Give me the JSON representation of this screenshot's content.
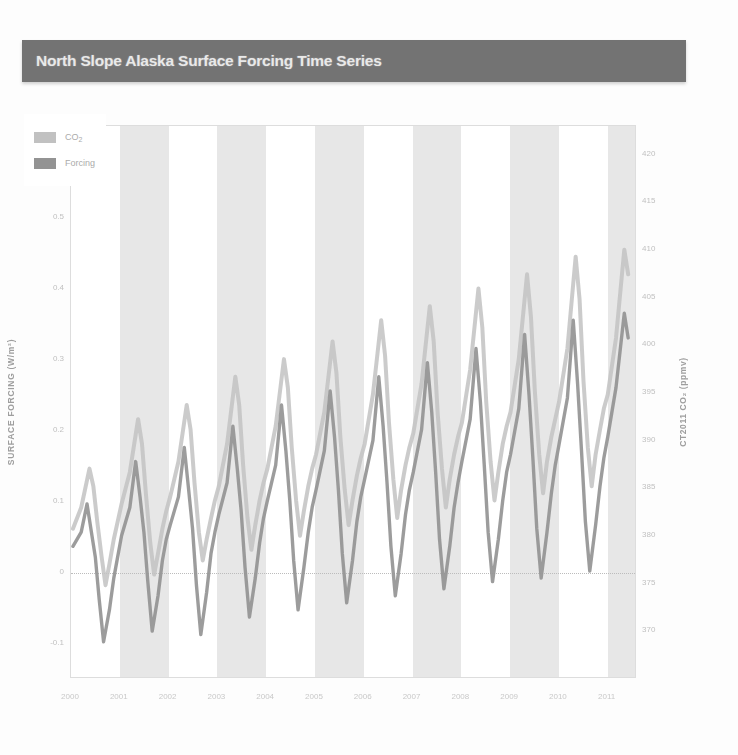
{
  "header": {
    "title": "North Slope Alaska Surface Forcing Time Series",
    "banner_color": "#737373",
    "title_color": "#f2f2f2"
  },
  "chart_data": {
    "type": "line",
    "title": "North Slope Alaska Surface Forcing Time Series",
    "ylabel_left": "SURFACE FORCING (W/m²)",
    "ylabel_right": "CT2011 CO₂ (ppmv)",
    "xlabel": "",
    "grid": false,
    "legend_position": "top-left",
    "zero_reference_line": true,
    "year_shading": true,
    "ylim_left": [
      -0.15,
      0.63
    ],
    "ylim_right": [
      365,
      423
    ],
    "yticks_left": [
      0.6,
      0.5,
      0.4,
      0.3,
      0.2,
      0.1,
      0,
      -0.1
    ],
    "ytick_labels_left": [
      "0.6",
      "0.5",
      "0.4",
      "0.3",
      "0.2",
      "0.1",
      "0",
      "-0.1"
    ],
    "yticks_right": [
      420,
      415,
      410,
      405,
      400,
      395,
      390,
      385,
      380,
      375,
      370
    ],
    "ytick_labels_right": [
      "420",
      "415",
      "410",
      "405",
      "400",
      "395",
      "390",
      "385",
      "380",
      "375",
      "370"
    ],
    "xlim": [
      2000,
      2011.6
    ],
    "xticks": [
      2000,
      2001,
      2002,
      2003,
      2004,
      2005,
      2006,
      2007,
      2008,
      2009,
      2010,
      2011
    ],
    "xtick_labels": [
      "2000",
      "2001",
      "2002",
      "2003",
      "2004",
      "2005",
      "2006",
      "2007",
      "2008",
      "2009",
      "2010",
      "2011"
    ],
    "series": [
      {
        "name": "CO2",
        "color": "#bfbfbf",
        "axis": "right",
        "x": [
          2000.04,
          2000.21,
          2000.38,
          2000.46,
          2000.54,
          2000.63,
          2000.71,
          2000.79,
          2000.88,
          2000.96,
          2001.04,
          2001.21,
          2001.38,
          2001.46,
          2001.54,
          2001.63,
          2001.71,
          2001.79,
          2001.88,
          2001.96,
          2002.04,
          2002.21,
          2002.38,
          2002.46,
          2002.54,
          2002.63,
          2002.71,
          2002.79,
          2002.88,
          2002.96,
          2003.04,
          2003.21,
          2003.38,
          2003.46,
          2003.54,
          2003.63,
          2003.71,
          2003.79,
          2003.88,
          2003.96,
          2004.04,
          2004.21,
          2004.38,
          2004.46,
          2004.54,
          2004.63,
          2004.71,
          2004.79,
          2004.88,
          2004.96,
          2005.04,
          2005.21,
          2005.38,
          2005.46,
          2005.54,
          2005.63,
          2005.71,
          2005.79,
          2005.88,
          2005.96,
          2006.04,
          2006.21,
          2006.38,
          2006.46,
          2006.54,
          2006.63,
          2006.71,
          2006.79,
          2006.88,
          2006.96,
          2007.04,
          2007.21,
          2007.38,
          2007.46,
          2007.54,
          2007.63,
          2007.71,
          2007.79,
          2007.88,
          2007.96,
          2008.04,
          2008.21,
          2008.38,
          2008.46,
          2008.54,
          2008.63,
          2008.71,
          2008.79,
          2008.88,
          2008.96,
          2009.04,
          2009.21,
          2009.38,
          2009.46,
          2009.54,
          2009.63,
          2009.71,
          2009.79,
          2009.88,
          2009.96,
          2010.04,
          2010.21,
          2010.38,
          2010.46,
          2010.54,
          2010.63,
          2010.71,
          2010.79,
          2010.88,
          2010.96,
          2011.04,
          2011.21,
          2011.38,
          2011.46
        ],
        "values": [
          0.06,
          0.09,
          0.145,
          0.12,
          0.07,
          0.02,
          -0.02,
          0.01,
          0.045,
          0.07,
          0.095,
          0.14,
          0.215,
          0.18,
          0.11,
          0.04,
          -0.005,
          0.025,
          0.06,
          0.085,
          0.105,
          0.155,
          0.235,
          0.2,
          0.125,
          0.055,
          0.015,
          0.045,
          0.075,
          0.1,
          0.12,
          0.18,
          0.275,
          0.235,
          0.15,
          0.075,
          0.03,
          0.065,
          0.1,
          0.125,
          0.145,
          0.205,
          0.3,
          0.26,
          0.175,
          0.1,
          0.05,
          0.085,
          0.12,
          0.145,
          0.165,
          0.225,
          0.325,
          0.28,
          0.19,
          0.115,
          0.065,
          0.1,
          0.135,
          0.16,
          0.18,
          0.25,
          0.355,
          0.305,
          0.21,
          0.13,
          0.075,
          0.115,
          0.15,
          0.175,
          0.195,
          0.265,
          0.375,
          0.325,
          0.225,
          0.145,
          0.09,
          0.13,
          0.165,
          0.19,
          0.21,
          0.285,
          0.4,
          0.345,
          0.24,
          0.155,
          0.1,
          0.14,
          0.18,
          0.205,
          0.225,
          0.3,
          0.42,
          0.36,
          0.255,
          0.165,
          0.11,
          0.155,
          0.19,
          0.215,
          0.24,
          0.315,
          0.445,
          0.385,
          0.27,
          0.175,
          0.12,
          0.165,
          0.2,
          0.23,
          0.25,
          0.33,
          0.455,
          0.42
        ]
      },
      {
        "name": "Forcing",
        "color": "#8f8f8f",
        "axis": "left",
        "x": [
          2000.04,
          2000.21,
          2000.33,
          2000.42,
          2000.5,
          2000.58,
          2000.67,
          2000.79,
          2000.88,
          2000.96,
          2001.04,
          2001.21,
          2001.33,
          2001.42,
          2001.5,
          2001.58,
          2001.67,
          2001.79,
          2001.88,
          2001.96,
          2002.04,
          2002.21,
          2002.33,
          2002.42,
          2002.5,
          2002.58,
          2002.67,
          2002.79,
          2002.88,
          2002.96,
          2003.04,
          2003.21,
          2003.33,
          2003.42,
          2003.5,
          2003.58,
          2003.67,
          2003.79,
          2003.88,
          2003.96,
          2004.04,
          2004.21,
          2004.33,
          2004.42,
          2004.5,
          2004.58,
          2004.67,
          2004.79,
          2004.88,
          2004.96,
          2005.04,
          2005.21,
          2005.33,
          2005.42,
          2005.5,
          2005.58,
          2005.67,
          2005.79,
          2005.88,
          2005.96,
          2006.04,
          2006.21,
          2006.33,
          2006.42,
          2006.5,
          2006.58,
          2006.67,
          2006.79,
          2006.88,
          2006.96,
          2007.04,
          2007.21,
          2007.33,
          2007.42,
          2007.5,
          2007.58,
          2007.67,
          2007.79,
          2007.88,
          2007.96,
          2008.04,
          2008.21,
          2008.33,
          2008.42,
          2008.5,
          2008.58,
          2008.67,
          2008.79,
          2008.88,
          2008.96,
          2009.04,
          2009.21,
          2009.33,
          2009.42,
          2009.5,
          2009.58,
          2009.67,
          2009.79,
          2009.88,
          2009.96,
          2010.04,
          2010.21,
          2010.33,
          2010.42,
          2010.5,
          2010.58,
          2010.67,
          2010.79,
          2010.88,
          2010.96,
          2011.04,
          2011.21,
          2011.38,
          2011.46
        ],
        "values": [
          0.035,
          0.055,
          0.095,
          0.055,
          0.02,
          -0.04,
          -0.1,
          -0.055,
          -0.01,
          0.02,
          0.05,
          0.09,
          0.155,
          0.105,
          0.055,
          -0.015,
          -0.085,
          -0.035,
          0.015,
          0.045,
          0.065,
          0.105,
          0.175,
          0.115,
          0.06,
          -0.02,
          -0.09,
          -0.03,
          0.025,
          0.055,
          0.08,
          0.125,
          0.205,
          0.145,
          0.085,
          0.005,
          -0.065,
          -0.01,
          0.04,
          0.075,
          0.1,
          0.15,
          0.235,
          0.17,
          0.1,
          0.015,
          -0.055,
          0.005,
          0.055,
          0.09,
          0.115,
          0.17,
          0.255,
          0.19,
          0.115,
          0.025,
          -0.045,
          0.015,
          0.07,
          0.105,
          0.13,
          0.185,
          0.275,
          0.205,
          0.125,
          0.035,
          -0.035,
          0.025,
          0.08,
          0.115,
          0.14,
          0.2,
          0.295,
          0.225,
          0.14,
          0.045,
          -0.025,
          0.035,
          0.09,
          0.125,
          0.155,
          0.215,
          0.315,
          0.24,
          0.15,
          0.055,
          -0.015,
          0.045,
          0.1,
          0.14,
          0.165,
          0.23,
          0.335,
          0.25,
          0.16,
          0.06,
          -0.01,
          0.055,
          0.11,
          0.15,
          0.18,
          0.245,
          0.355,
          0.265,
          0.17,
          0.07,
          0.0,
          0.065,
          0.12,
          0.16,
          0.19,
          0.26,
          0.365,
          0.33
        ]
      }
    ]
  }
}
